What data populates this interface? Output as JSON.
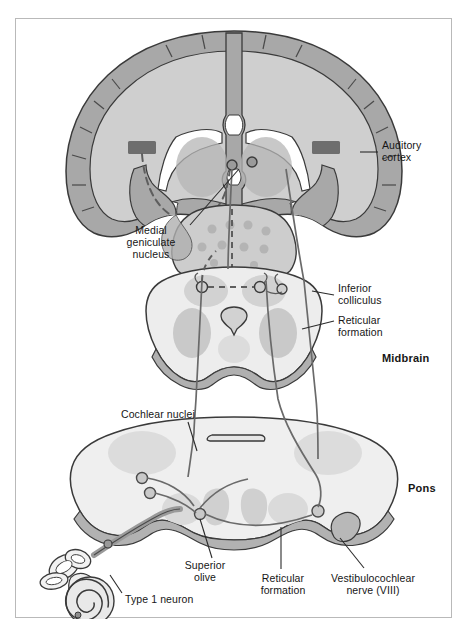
{
  "figure": {
    "type": "anatomical-diagram",
    "border_color": "#b9b9b9",
    "background": "#ffffff"
  },
  "palette": {
    "outline": "#3a3a3a",
    "cortex_ribbon": "#a8a8a8",
    "white_matter": "#cfcfcf",
    "brainstem_fill": "#ededed",
    "brainstem_rim": "#b0b0b0",
    "nucleus_shade": "#c4c4c4",
    "reticular_shade": "#c9c9c9",
    "auditory_cortex_patch": "#6e6e6e",
    "pathway_line": "#6a6a6a",
    "dashed_pathway": "#5e5e5e",
    "ventricle": "#ffffff",
    "leader_line": "#2b2b2b"
  },
  "labels": [
    {
      "id": "auditory-cortex",
      "text": "Auditory\ncortex",
      "align": "left",
      "x": 366,
      "y": 120,
      "leader": {
        "x1": 362,
        "y1": 133,
        "x2": 344,
        "y2": 133
      }
    },
    {
      "id": "medial-geniculate-nucleus",
      "text": "Medial\ngeniculate\nnucleus",
      "align": "center",
      "x": 96,
      "y": 205,
      "leader": {
        "x1": 174,
        "y1": 206,
        "x2": 223,
        "y2": 150
      }
    },
    {
      "id": "inferior-colliculus",
      "text": "Inferior\ncolliculus",
      "align": "left",
      "x": 322,
      "y": 263,
      "leader": {
        "x1": 318,
        "y1": 276,
        "x2": 296,
        "y2": 272
      }
    },
    {
      "id": "reticular-formation-midbrain",
      "text": "Reticular\nformation",
      "align": "left",
      "x": 322,
      "y": 295,
      "leader": {
        "x1": 318,
        "y1": 302,
        "x2": 286,
        "y2": 310
      }
    },
    {
      "id": "midbrain",
      "text": "Midbrain",
      "align": "left",
      "bold": true,
      "x": 366,
      "y": 333
    },
    {
      "id": "cochlear-nuclei",
      "text": "Cochlear nuclei",
      "align": "left",
      "x": 105,
      "y": 389,
      "leader": {
        "x1": 172,
        "y1": 403,
        "x2": 181,
        "y2": 432
      }
    },
    {
      "id": "pons",
      "text": "Pons",
      "align": "left",
      "bold": true,
      "x": 392,
      "y": 463
    },
    {
      "id": "superior-olive",
      "text": "Superior\nolive",
      "align": "center",
      "x": 160,
      "y": 540,
      "leader": {
        "x1": 196,
        "y1": 539,
        "x2": 184,
        "y2": 500
      }
    },
    {
      "id": "reticular-formation-pons",
      "text": "Reticular\nformation",
      "align": "center",
      "x": 239,
      "y": 553,
      "leader": {
        "x1": 265,
        "y1": 550,
        "x2": 265,
        "y2": 508
      }
    },
    {
      "id": "vestibulocochlear-nerve",
      "text": "Vestibulocochlear\nnerve (VIII)",
      "align": "center",
      "x": 307,
      "y": 553,
      "leader": {
        "x1": 348,
        "y1": 549,
        "x2": 324,
        "y2": 519
      }
    },
    {
      "id": "type-1-neuron",
      "text": "Type 1 neuron",
      "align": "left",
      "x": 109,
      "y": 574,
      "leader": {
        "x1": 106,
        "y1": 574,
        "x2": 94,
        "y2": 556
      }
    }
  ],
  "structures": [
    {
      "id": "cerebrum-coronal-section",
      "region": "top"
    },
    {
      "id": "lateral-ventricles",
      "region": "top"
    },
    {
      "id": "thalamus",
      "region": "top"
    },
    {
      "id": "midbrain-section",
      "region": "middle"
    },
    {
      "id": "cerebral-aqueduct",
      "region": "middle"
    },
    {
      "id": "pons-section",
      "region": "lower"
    },
    {
      "id": "fourth-ventricle",
      "region": "lower"
    },
    {
      "id": "inner-ear-cochlea",
      "region": "bottom-left"
    },
    {
      "id": "semicircular-canals",
      "region": "bottom-left"
    }
  ]
}
